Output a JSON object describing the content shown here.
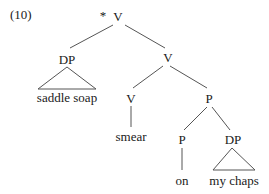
{
  "example_number": "(10)",
  "tree": {
    "root": {
      "mark": "*",
      "label": "V"
    },
    "subject": {
      "label": "DP",
      "terminal": "saddle soap"
    },
    "vbar": {
      "label": "V"
    },
    "verb": {
      "label": "V",
      "terminal": "smear"
    },
    "pp": {
      "label": "P"
    },
    "prep": {
      "label": "P",
      "terminal": "on"
    },
    "object": {
      "label": "DP",
      "terminal": "my chaps"
    }
  }
}
